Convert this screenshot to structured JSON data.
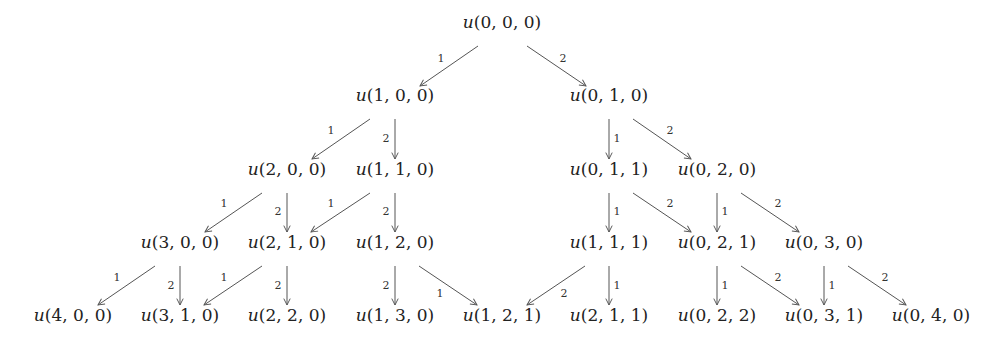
{
  "diagram": {
    "type": "tree",
    "colors": {
      "text": "#222222",
      "edge": "#555555",
      "background": "#ffffff"
    },
    "nodes": [
      {
        "id": "000",
        "label": "u(0, 0, 0)",
        "fn": "u",
        "args": "(0, 0, 0)",
        "x": 502,
        "y": 28
      },
      {
        "id": "100",
        "label": "u(1, 0, 0)",
        "fn": "u",
        "args": "(1, 0, 0)",
        "x": 395,
        "y": 101
      },
      {
        "id": "010",
        "label": "u(0, 1, 0)",
        "fn": "u",
        "args": "(0, 1, 0)",
        "x": 609,
        "y": 101
      },
      {
        "id": "200",
        "label": "u(2, 0, 0)",
        "fn": "u",
        "args": "(2, 0, 0)",
        "x": 287,
        "y": 175
      },
      {
        "id": "110",
        "label": "u(1, 1, 0)",
        "fn": "u",
        "args": "(1, 1, 0)",
        "x": 395,
        "y": 175
      },
      {
        "id": "011",
        "label": "u(0, 1, 1)",
        "fn": "u",
        "args": "(0, 1, 1)",
        "x": 609,
        "y": 175
      },
      {
        "id": "020",
        "label": "u(0, 2, 0)",
        "fn": "u",
        "args": "(0, 2, 0)",
        "x": 717,
        "y": 175
      },
      {
        "id": "300",
        "label": "u(3, 0, 0)",
        "fn": "u",
        "args": "(3, 0, 0)",
        "x": 180,
        "y": 248
      },
      {
        "id": "210",
        "label": "u(2, 1, 0)",
        "fn": "u",
        "args": "(2, 1, 0)",
        "x": 287,
        "y": 248
      },
      {
        "id": "120",
        "label": "u(1, 2, 0)",
        "fn": "u",
        "args": "(1, 2, 0)",
        "x": 395,
        "y": 248
      },
      {
        "id": "111",
        "label": "u(1, 1, 1)",
        "fn": "u",
        "args": "(1, 1, 1)",
        "x": 609,
        "y": 248
      },
      {
        "id": "021",
        "label": "u(0, 2, 1)",
        "fn": "u",
        "args": "(0, 2, 1)",
        "x": 717,
        "y": 248
      },
      {
        "id": "030",
        "label": "u(0, 3, 0)",
        "fn": "u",
        "args": "(0, 3, 0)",
        "x": 824,
        "y": 248
      },
      {
        "id": "400",
        "label": "u(4, 0, 0)",
        "fn": "u",
        "args": "(4, 0, 0)",
        "x": 73,
        "y": 321
      },
      {
        "id": "310",
        "label": "u(3, 1, 0)",
        "fn": "u",
        "args": "(3, 1, 0)",
        "x": 180,
        "y": 321
      },
      {
        "id": "220",
        "label": "u(2, 2, 0)",
        "fn": "u",
        "args": "(2, 2, 0)",
        "x": 287,
        "y": 321
      },
      {
        "id": "130",
        "label": "u(1, 3, 0)",
        "fn": "u",
        "args": "(1, 3, 0)",
        "x": 395,
        "y": 321
      },
      {
        "id": "121",
        "label": "u(1, 2, 1)",
        "fn": "u",
        "args": "(1, 2, 1)",
        "x": 502,
        "y": 321
      },
      {
        "id": "211",
        "label": "u(2, 1, 1)",
        "fn": "u",
        "args": "(2, 1, 1)",
        "x": 609,
        "y": 321
      },
      {
        "id": "022",
        "label": "u(0, 2, 2)",
        "fn": "u",
        "args": "(0, 2, 2)",
        "x": 717,
        "y": 321
      },
      {
        "id": "031",
        "label": "u(0, 3, 1)",
        "fn": "u",
        "args": "(0, 3, 1)",
        "x": 824,
        "y": 321
      },
      {
        "id": "040",
        "label": "u(0, 4, 0)",
        "fn": "u",
        "args": "(0, 4, 0)",
        "x": 931,
        "y": 321
      }
    ],
    "edges": [
      {
        "from": "000",
        "to": "100",
        "label": "1",
        "x1": 478,
        "y1": 46,
        "x2": 420,
        "y2": 86,
        "lx": 441,
        "ly": 62
      },
      {
        "from": "000",
        "to": "010",
        "label": "2",
        "x1": 527,
        "y1": 46,
        "x2": 586,
        "y2": 86,
        "lx": 563,
        "ly": 62
      },
      {
        "from": "100",
        "to": "200",
        "label": "1",
        "x1": 370,
        "y1": 119,
        "x2": 312,
        "y2": 159,
        "lx": 331,
        "ly": 134
      },
      {
        "from": "100",
        "to": "110",
        "label": "2",
        "x1": 395,
        "y1": 119,
        "x2": 395,
        "y2": 159,
        "lx": 386,
        "ly": 142
      },
      {
        "from": "010",
        "to": "011",
        "label": "1",
        "x1": 609,
        "y1": 119,
        "x2": 609,
        "y2": 159,
        "lx": 617,
        "ly": 142
      },
      {
        "from": "010",
        "to": "020",
        "label": "2",
        "x1": 633,
        "y1": 119,
        "x2": 691,
        "y2": 159,
        "lx": 670,
        "ly": 134
      },
      {
        "from": "200",
        "to": "300",
        "label": "1",
        "x1": 262,
        "y1": 193,
        "x2": 205,
        "y2": 232,
        "lx": 224,
        "ly": 207
      },
      {
        "from": "200",
        "to": "210",
        "label": "2",
        "x1": 287,
        "y1": 193,
        "x2": 287,
        "y2": 232,
        "lx": 278,
        "ly": 215
      },
      {
        "from": "110",
        "to": "210",
        "label": "1",
        "x1": 370,
        "y1": 193,
        "x2": 311,
        "y2": 232,
        "lx": 331,
        "ly": 207
      },
      {
        "from": "110",
        "to": "120",
        "label": "2",
        "x1": 395,
        "y1": 193,
        "x2": 395,
        "y2": 232,
        "lx": 386,
        "ly": 215
      },
      {
        "from": "011",
        "to": "111",
        "label": "1",
        "x1": 609,
        "y1": 193,
        "x2": 609,
        "y2": 232,
        "lx": 617,
        "ly": 215
      },
      {
        "from": "011",
        "to": "021",
        "label": "2",
        "x1": 633,
        "y1": 193,
        "x2": 691,
        "y2": 232,
        "lx": 670,
        "ly": 207
      },
      {
        "from": "020",
        "to": "021",
        "label": "1",
        "x1": 717,
        "y1": 193,
        "x2": 717,
        "y2": 232,
        "lx": 725,
        "ly": 215
      },
      {
        "from": "020",
        "to": "030",
        "label": "2",
        "x1": 741,
        "y1": 193,
        "x2": 799,
        "y2": 232,
        "lx": 778,
        "ly": 207
      },
      {
        "from": "300",
        "to": "400",
        "label": "1",
        "x1": 155,
        "y1": 266,
        "x2": 98,
        "y2": 305,
        "lx": 117,
        "ly": 281
      },
      {
        "from": "300",
        "to": "310",
        "label": "2",
        "x1": 180,
        "y1": 266,
        "x2": 180,
        "y2": 305,
        "lx": 171,
        "ly": 289
      },
      {
        "from": "210",
        "to": "310",
        "label": "1",
        "x1": 262,
        "y1": 266,
        "x2": 204,
        "y2": 305,
        "lx": 224,
        "ly": 281
      },
      {
        "from": "210",
        "to": "220",
        "label": "2",
        "x1": 287,
        "y1": 266,
        "x2": 287,
        "y2": 305,
        "lx": 278,
        "ly": 289
      },
      {
        "from": "120",
        "to": "130",
        "label": "2",
        "x1": 395,
        "y1": 266,
        "x2": 395,
        "y2": 305,
        "lx": 386,
        "ly": 289
      },
      {
        "from": "120",
        "to": "121",
        "label": "1",
        "x1": 419,
        "y1": 266,
        "x2": 477,
        "y2": 305,
        "lx": 440,
        "ly": 297
      },
      {
        "from": "111",
        "to": "121",
        "label": "2",
        "x1": 585,
        "y1": 266,
        "x2": 527,
        "y2": 305,
        "lx": 564,
        "ly": 297
      },
      {
        "from": "111",
        "to": "211",
        "label": "1",
        "x1": 609,
        "y1": 266,
        "x2": 609,
        "y2": 305,
        "lx": 617,
        "ly": 289
      },
      {
        "from": "021",
        "to": "022",
        "label": "1",
        "x1": 717,
        "y1": 266,
        "x2": 717,
        "y2": 305,
        "lx": 725,
        "ly": 289
      },
      {
        "from": "021",
        "to": "031",
        "label": "2",
        "x1": 741,
        "y1": 266,
        "x2": 799,
        "y2": 305,
        "lx": 778,
        "ly": 281
      },
      {
        "from": "030",
        "to": "031",
        "label": "1",
        "x1": 824,
        "y1": 266,
        "x2": 824,
        "y2": 305,
        "lx": 832,
        "ly": 289
      },
      {
        "from": "030",
        "to": "040",
        "label": "2",
        "x1": 848,
        "y1": 266,
        "x2": 906,
        "y2": 305,
        "lx": 885,
        "ly": 281
      }
    ]
  }
}
